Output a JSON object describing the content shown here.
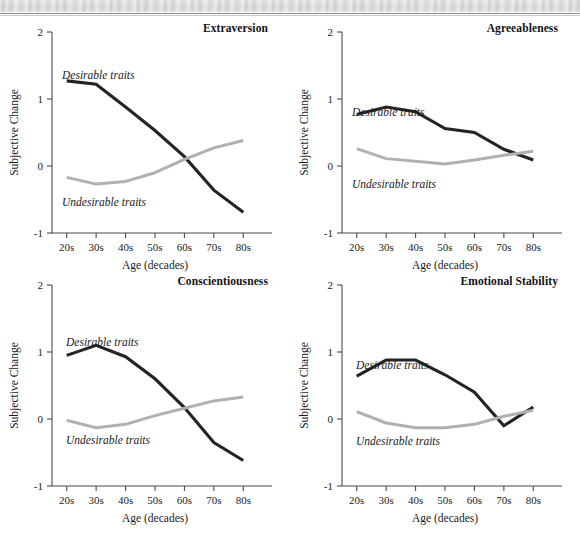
{
  "figure": {
    "panels": [
      {
        "key": "extraversion",
        "title": "Extraversion",
        "series_label_desirable": "Desirable traits",
        "series_label_undesirable": "Undesirable traits",
        "xlabel": "Age (decades)",
        "ylabel": "Subjective Change"
      },
      {
        "key": "agreeableness",
        "title": "Agreeableness",
        "series_label_desirable": "Desirable traits",
        "series_label_undesirable": "Undesirable traits",
        "xlabel": "Age (decades)",
        "ylabel": "Subjective Change"
      },
      {
        "key": "conscientiousness",
        "title": "Conscientiousness",
        "series_label_desirable": "Desirable traits",
        "series_label_undesirable": "Undesirable traits",
        "xlabel": "Age (decades)",
        "ylabel": "Subjective Change"
      },
      {
        "key": "emotional_stability",
        "title": "Emotional Stability",
        "series_label_desirable": "Desirable traits",
        "series_label_undesirable": "Undesirable traits",
        "xlabel": "Age (decades)",
        "ylabel": "Subjective Change"
      }
    ],
    "ytick_labels": [
      "2",
      "1",
      "0",
      "-1"
    ],
    "xtick_labels": [
      "20s",
      "30s",
      "40s",
      "50s",
      "60s",
      "70s",
      "80s"
    ],
    "colors": {
      "desirable": "#242424",
      "undesirable": "#b0b0b0",
      "axis": "#4a4a4a",
      "background": "#ffffff"
    }
  },
  "chart_data": [
    {
      "type": "line",
      "title": "Extraversion",
      "xlabel": "Age (decades)",
      "ylabel": "Subjective Change",
      "categories": [
        "20s",
        "30s",
        "40s",
        "50s",
        "60s",
        "70s",
        "80s"
      ],
      "ylim": [
        -1,
        2
      ],
      "yticks": [
        -1,
        0,
        1,
        2
      ],
      "grid": false,
      "legend": "inline-annotations",
      "series": [
        {
          "name": "Desirable traits",
          "color": "#242424",
          "values": [
            1.27,
            1.22,
            0.88,
            0.53,
            0.14,
            -0.36,
            -0.69
          ]
        },
        {
          "name": "Undesirable traits",
          "color": "#b0b0b0",
          "values": [
            -0.17,
            -0.27,
            -0.23,
            -0.1,
            0.1,
            0.27,
            0.38
          ]
        }
      ]
    },
    {
      "type": "line",
      "title": "Agreeableness",
      "xlabel": "Age (decades)",
      "ylabel": "Subjective Change",
      "categories": [
        "20s",
        "30s",
        "40s",
        "50s",
        "60s",
        "70s",
        "80s"
      ],
      "ylim": [
        -1,
        2
      ],
      "yticks": [
        -1,
        0,
        1,
        2
      ],
      "grid": false,
      "legend": "inline-annotations",
      "series": [
        {
          "name": "Desirable traits",
          "color": "#242424",
          "values": [
            0.77,
            0.88,
            0.81,
            0.56,
            0.5,
            0.25,
            0.09
          ]
        },
        {
          "name": "Undesirable traits",
          "color": "#b0b0b0",
          "values": [
            0.26,
            0.11,
            0.07,
            0.03,
            0.09,
            0.16,
            0.22
          ]
        }
      ]
    },
    {
      "type": "line",
      "title": "Conscientiousness",
      "xlabel": "Age (decades)",
      "ylabel": "Subjective Change",
      "categories": [
        "20s",
        "30s",
        "40s",
        "50s",
        "60s",
        "70s",
        "80s"
      ],
      "ylim": [
        -1,
        2
      ],
      "yticks": [
        -1,
        0,
        1,
        2
      ],
      "grid": false,
      "legend": "inline-annotations",
      "series": [
        {
          "name": "Desirable traits",
          "color": "#242424",
          "values": [
            0.95,
            1.1,
            0.93,
            0.6,
            0.17,
            -0.35,
            -0.62
          ]
        },
        {
          "name": "Undesirable traits",
          "color": "#b0b0b0",
          "values": [
            -0.02,
            -0.13,
            -0.08,
            0.05,
            0.16,
            0.27,
            0.33
          ]
        }
      ]
    },
    {
      "type": "line",
      "title": "Emotional Stability",
      "xlabel": "Age (decades)",
      "ylabel": "Subjective Change",
      "categories": [
        "20s",
        "30s",
        "40s",
        "50s",
        "60s",
        "70s",
        "80s"
      ],
      "ylim": [
        -1,
        2
      ],
      "yticks": [
        -1,
        0,
        1,
        2
      ],
      "grid": false,
      "legend": "inline-annotations",
      "series": [
        {
          "name": "Desirable traits",
          "color": "#242424",
          "values": [
            0.64,
            0.88,
            0.88,
            0.66,
            0.4,
            -0.1,
            0.18
          ]
        },
        {
          "name": "Undesirable traits",
          "color": "#b0b0b0",
          "values": [
            0.11,
            -0.06,
            -0.13,
            -0.13,
            -0.08,
            0.04,
            0.13
          ]
        }
      ]
    }
  ]
}
